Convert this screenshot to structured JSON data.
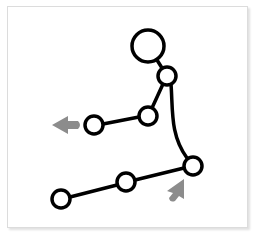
{
  "diagram": {
    "type": "stick-figure-pose",
    "colors": {
      "stroke": "#000000",
      "fill": "#ffffff",
      "arrow": "#8c8c8c",
      "frame_border": "#dcdcdc"
    },
    "joints": {
      "head": {
        "cx": 148,
        "cy": 46,
        "r": 16
      },
      "neck": {
        "cx": 167,
        "cy": 76,
        "r": 9
      },
      "elbow": {
        "cx": 148,
        "cy": 116,
        "r": 9
      },
      "hand": {
        "cx": 94,
        "cy": 125,
        "r": 9
      },
      "hip": {
        "cx": 193,
        "cy": 166,
        "r": 9
      },
      "knee": {
        "cx": 126,
        "cy": 182,
        "r": 9
      },
      "foot": {
        "cx": 61,
        "cy": 199,
        "r": 9
      }
    },
    "arrows": [
      {
        "name": "arm-direction-arrow",
        "direction": "left"
      },
      {
        "name": "hip-direction-arrow",
        "direction": "up-right"
      }
    ]
  }
}
